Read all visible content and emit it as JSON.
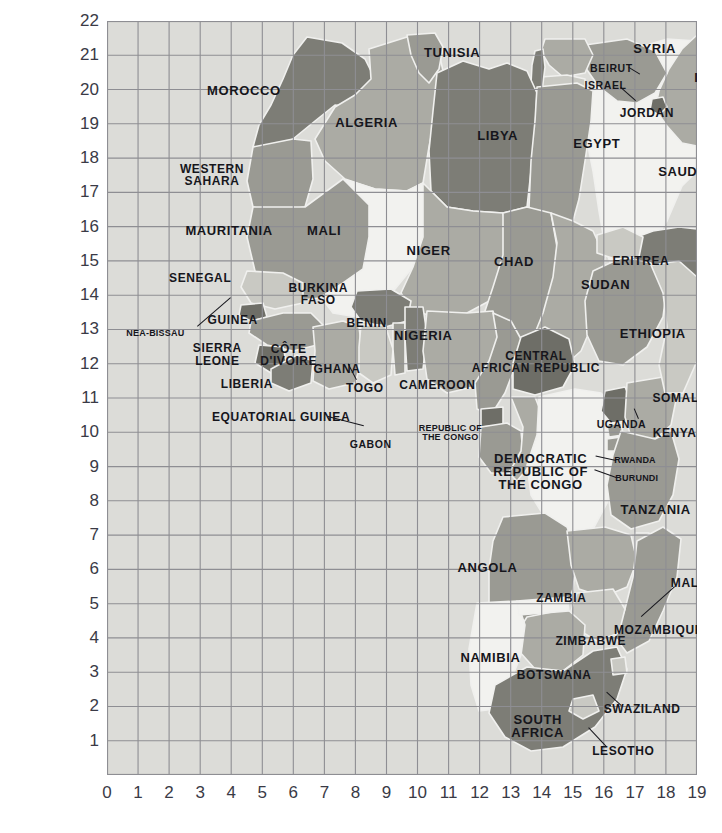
{
  "figure": {
    "kind": "map",
    "region": "Africa and adjacent Middle East",
    "background_color": "#ffffff",
    "ocean_color": "#dcdcd8",
    "grid_color": "#8e8e93",
    "border_color": "#f0f0ee",
    "text_color": "#16161c",
    "axis_text_color": "#3a3a46",
    "land_shades": {
      "light": "#f2f2ef",
      "mid_light": "#c9c9c3",
      "mid": "#ababa4",
      "mid_dark": "#9a9a93",
      "dark": "#7d7d76",
      "darker": "#6e6e67"
    }
  },
  "axes": {
    "x_ticks": [
      "0",
      "1",
      "2",
      "3",
      "4",
      "5",
      "6",
      "7",
      "8",
      "9",
      "10",
      "11",
      "12",
      "13",
      "14",
      "15",
      "16",
      "17",
      "18",
      "19"
    ],
    "y_ticks": [
      "22",
      "21",
      "20",
      "19",
      "18",
      "17",
      "16",
      "15",
      "14",
      "13",
      "12",
      "11",
      "10",
      "9",
      "8",
      "7",
      "6",
      "5",
      "4",
      "3",
      "2",
      "1"
    ],
    "x_range": [
      0,
      19
    ],
    "y_range": [
      0,
      22
    ],
    "grid": true
  },
  "labels": [
    {
      "name": "morocco",
      "text": "MOROCCO",
      "x": 0.232,
      "y": 0.093,
      "size": "sz-l"
    },
    {
      "name": "western-sahara",
      "text": "WESTERN\nSAHARA",
      "x": 0.178,
      "y": 0.204,
      "size": "sz-m"
    },
    {
      "name": "algeria",
      "text": "ALGERIA",
      "x": 0.44,
      "y": 0.135,
      "size": "sz-l"
    },
    {
      "name": "tunisia",
      "text": "TUNISIA",
      "x": 0.585,
      "y": 0.042,
      "size": "sz-l"
    },
    {
      "name": "libya",
      "text": "LIBYA",
      "x": 0.662,
      "y": 0.152,
      "size": "sz-l"
    },
    {
      "name": "egypt",
      "text": "EGYPT",
      "x": 0.83,
      "y": 0.163,
      "size": "sz-l"
    },
    {
      "name": "mauritania",
      "text": "MAURITANIA",
      "x": 0.207,
      "y": 0.278,
      "size": "sz-l"
    },
    {
      "name": "mali",
      "text": "MALI",
      "x": 0.368,
      "y": 0.278,
      "size": "sz-l"
    },
    {
      "name": "niger",
      "text": "NIGER",
      "x": 0.545,
      "y": 0.305,
      "size": "sz-l"
    },
    {
      "name": "chad",
      "text": "CHAD",
      "x": 0.69,
      "y": 0.32,
      "size": "sz-l"
    },
    {
      "name": "sudan",
      "text": "SUDAN",
      "x": 0.845,
      "y": 0.35,
      "size": "sz-l"
    },
    {
      "name": "senegal",
      "text": "SENEGAL",
      "x": 0.158,
      "y": 0.341,
      "size": "sz-m"
    },
    {
      "name": "guinea-bissau",
      "text": "NEA-BISSAU",
      "x": 0.082,
      "y": 0.415,
      "size": "sz-xs"
    },
    {
      "name": "guinea",
      "text": "GUINEA",
      "x": 0.213,
      "y": 0.396,
      "size": "sz-m"
    },
    {
      "name": "sierra-leone",
      "text": "SIERRA\nLEONE",
      "x": 0.187,
      "y": 0.442,
      "size": "sz-m"
    },
    {
      "name": "liberia",
      "text": "LIBERIA",
      "x": 0.237,
      "y": 0.482,
      "size": "sz-m"
    },
    {
      "name": "cote-divoire",
      "text": "CÔTE\nD'IVOIRE",
      "x": 0.308,
      "y": 0.443,
      "size": "sz-m"
    },
    {
      "name": "ghana",
      "text": "GHANA",
      "x": 0.39,
      "y": 0.462,
      "size": "sz-m"
    },
    {
      "name": "burkina-faso",
      "text": "BURKINA\nFASO",
      "x": 0.358,
      "y": 0.362,
      "size": "sz-m"
    },
    {
      "name": "togo",
      "text": "TOGO",
      "x": 0.437,
      "y": 0.487,
      "size": "sz-m"
    },
    {
      "name": "benin",
      "text": "BENIN",
      "x": 0.44,
      "y": 0.4,
      "size": "sz-m"
    },
    {
      "name": "nigeria",
      "text": "NIGERIA",
      "x": 0.536,
      "y": 0.418,
      "size": "sz-l"
    },
    {
      "name": "cameroon",
      "text": "CAMEROON",
      "x": 0.56,
      "y": 0.483,
      "size": "sz-m"
    },
    {
      "name": "central-african-republic",
      "text": "CENTRAL\nAFRICAN REPUBLIC",
      "x": 0.727,
      "y": 0.452,
      "size": "sz-m"
    },
    {
      "name": "equatorial-guinea",
      "text": "EQUATORIAL GUINEA",
      "x": 0.295,
      "y": 0.525,
      "size": "sz-m"
    },
    {
      "name": "gabon",
      "text": "GABON",
      "x": 0.447,
      "y": 0.561,
      "size": "sz-s"
    },
    {
      "name": "republic-of-the-congo",
      "text": "REPUBLIC OF\nTHE CONGO",
      "x": 0.582,
      "y": 0.546,
      "size": "sz-xs"
    },
    {
      "name": "democratic-republic-of-the-congo",
      "text": "DEMOCRATIC\nREPUBLIC OF\nTHE CONGO",
      "x": 0.735,
      "y": 0.598,
      "size": "sz-l"
    },
    {
      "name": "uganda",
      "text": "UGANDA",
      "x": 0.872,
      "y": 0.535,
      "size": "sz-s"
    },
    {
      "name": "kenya",
      "text": "KENYA",
      "x": 0.962,
      "y": 0.547,
      "size": "sz-m"
    },
    {
      "name": "rwanda",
      "text": "RWANDA",
      "x": 0.895,
      "y": 0.584,
      "size": "sz-xs"
    },
    {
      "name": "burundi",
      "text": "BURUNDI",
      "x": 0.898,
      "y": 0.608,
      "size": "sz-xs"
    },
    {
      "name": "tanzania",
      "text": "TANZANIA",
      "x": 0.93,
      "y": 0.648,
      "size": "sz-l"
    },
    {
      "name": "ethiopia",
      "text": "ETHIOPIA",
      "x": 0.925,
      "y": 0.415,
      "size": "sz-l"
    },
    {
      "name": "eritrea",
      "text": "ERITREA",
      "x": 0.905,
      "y": 0.318,
      "size": "sz-m"
    },
    {
      "name": "somalia",
      "text": "SOMALIA",
      "x": 0.975,
      "y": 0.5,
      "size": "sz-m"
    },
    {
      "name": "yemen",
      "text": "YEMEN",
      "x": 1.055,
      "y": 0.322,
      "size": "sz-l"
    },
    {
      "name": "saudi-arabia",
      "text": "SAUDI ARABIA",
      "x": 1.02,
      "y": 0.2,
      "size": "sz-l"
    },
    {
      "name": "iraq",
      "text": "IRAQ",
      "x": 1.025,
      "y": 0.075,
      "size": "sz-l"
    },
    {
      "name": "iran",
      "text": "IRAN",
      "x": 1.11,
      "y": 0.07,
      "size": "sz-l"
    },
    {
      "name": "kuwait",
      "text": "KUWAIT",
      "x": 1.04,
      "y": 0.125,
      "size": "sz-s"
    },
    {
      "name": "syria",
      "text": "SYRIA",
      "x": 0.928,
      "y": 0.037,
      "size": "sz-l"
    },
    {
      "name": "beirut",
      "text": "BEIRUT",
      "x": 0.855,
      "y": 0.062,
      "size": "sz-s"
    },
    {
      "name": "israel",
      "text": "ISRAEL",
      "x": 0.845,
      "y": 0.085,
      "size": "sz-s"
    },
    {
      "name": "jordan",
      "text": "JORDAN",
      "x": 0.915,
      "y": 0.122,
      "size": "sz-m"
    },
    {
      "name": "angola",
      "text": "ANGOLA",
      "x": 0.645,
      "y": 0.725,
      "size": "sz-l"
    },
    {
      "name": "zambia",
      "text": "ZAMBIA",
      "x": 0.77,
      "y": 0.765,
      "size": "sz-m"
    },
    {
      "name": "malawi",
      "text": "MALAWI",
      "x": 1.0,
      "y": 0.745,
      "size": "sz-m"
    },
    {
      "name": "mozambique",
      "text": "MOZAMBIQUE",
      "x": 0.935,
      "y": 0.808,
      "size": "sz-m"
    },
    {
      "name": "zimbabwe",
      "text": "ZIMBABWE",
      "x": 0.82,
      "y": 0.822,
      "size": "sz-m"
    },
    {
      "name": "namibia",
      "text": "NAMIBIA",
      "x": 0.65,
      "y": 0.845,
      "size": "sz-l"
    },
    {
      "name": "botswana",
      "text": "BOTSWANA",
      "x": 0.758,
      "y": 0.868,
      "size": "sz-m"
    },
    {
      "name": "madagascar",
      "text": "MADAGASCAR",
      "x": 1.1,
      "y": 0.825,
      "size": "sz-m"
    },
    {
      "name": "south-africa",
      "text": "SOUTH\nAFRICA",
      "x": 0.73,
      "y": 0.935,
      "size": "sz-l"
    },
    {
      "name": "swaziland",
      "text": "SWAZILAND",
      "x": 0.907,
      "y": 0.912,
      "size": "sz-m"
    },
    {
      "name": "lesotho",
      "text": "LESOTHO",
      "x": 0.875,
      "y": 0.968,
      "size": "sz-m"
    }
  ],
  "leaders": [
    {
      "name": "leader-guinea-bissau",
      "x1": 0.152,
      "y1": 0.405,
      "x2": 0.208,
      "y2": 0.367
    },
    {
      "name": "leader-equatorial-guinea",
      "x1": 0.375,
      "y1": 0.524,
      "x2": 0.435,
      "y2": 0.536
    },
    {
      "name": "leader-togo",
      "x1": 0.422,
      "y1": 0.476,
      "x2": 0.408,
      "y2": 0.455
    },
    {
      "name": "leader-malawi",
      "x1": 0.962,
      "y1": 0.75,
      "x2": 0.905,
      "y2": 0.79
    },
    {
      "name": "leader-swaziland",
      "x1": 0.872,
      "y1": 0.909,
      "x2": 0.847,
      "y2": 0.891
    },
    {
      "name": "leader-lesotho",
      "x1": 0.845,
      "y1": 0.963,
      "x2": 0.815,
      "y2": 0.938
    },
    {
      "name": "leader-rwanda",
      "x1": 0.862,
      "y1": 0.583,
      "x2": 0.828,
      "y2": 0.577
    },
    {
      "name": "leader-burundi",
      "x1": 0.862,
      "y1": 0.606,
      "x2": 0.826,
      "y2": 0.596
    },
    {
      "name": "leader-beirut",
      "x1": 0.884,
      "y1": 0.061,
      "x2": 0.903,
      "y2": 0.07
    },
    {
      "name": "leader-israel",
      "x1": 0.872,
      "y1": 0.087,
      "x2": 0.898,
      "y2": 0.105
    },
    {
      "name": "leader-kuwait",
      "x1": 1.062,
      "y1": 0.122,
      "x2": 1.045,
      "y2": 0.107
    },
    {
      "name": "leader-uganda",
      "x1": 0.9,
      "y1": 0.528,
      "x2": 0.893,
      "y2": 0.515
    }
  ]
}
